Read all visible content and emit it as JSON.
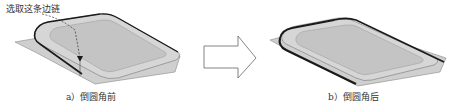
{
  "figure": {
    "panel_a": {
      "callout": "选取这条边链",
      "caption": "a）倒圆角前"
    },
    "panel_b": {
      "caption": "b）倒圆角后"
    },
    "arrow": "right-arrow"
  },
  "colors": {
    "surface": "#c8c8c8",
    "surface_light": "#dcdcdc",
    "edge": "#1a1a1a",
    "outline": "#777777"
  }
}
